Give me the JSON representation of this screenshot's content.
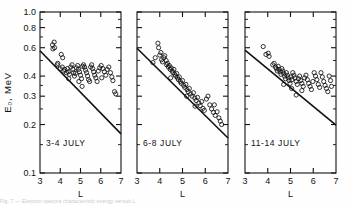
{
  "figure": {
    "axis_labels": {
      "y": "E₀, MeV",
      "y_plain": "E0, MeV",
      "x": "L"
    },
    "partial_caption": "Fig. 7 — Electron spectra characteristic energy versus L"
  },
  "chart_data": {
    "type": "scatter",
    "title": "",
    "xlabel": "L",
    "ylabel": "E₀, MeV",
    "yscale": "log",
    "xscale": "linear",
    "xlim": [
      3,
      7
    ],
    "ylim": [
      0.1,
      1.0
    ],
    "grid": false,
    "legend": null,
    "xticks": [
      3,
      4,
      5,
      6,
      7
    ],
    "xticklabels": [
      "3",
      "4",
      "5",
      "6",
      "7"
    ],
    "yticks": [
      1.0,
      0.8,
      0.6,
      0.4,
      0.3,
      0.2,
      0.1
    ],
    "yticklabels": [
      "1.0",
      "0.8",
      "0.6",
      "0.4",
      "0.3",
      "0.2",
      "0.1"
    ],
    "yminorticks": [
      0.9,
      0.7,
      0.5,
      0.35,
      0.25,
      0.15
    ],
    "marker": "open-circle",
    "panels": [
      {
        "label": "3-4 JULY",
        "trendline": {
          "x": [
            3,
            7
          ],
          "y": [
            0.575,
            0.175
          ]
        },
        "points": [
          [
            3.62,
            0.625
          ],
          [
            3.7,
            0.65
          ],
          [
            3.64,
            0.59
          ],
          [
            3.72,
            0.6
          ],
          [
            3.85,
            0.47
          ],
          [
            3.88,
            0.48
          ],
          [
            4.05,
            0.545
          ],
          [
            4.12,
            0.52
          ],
          [
            4.0,
            0.445
          ],
          [
            4.1,
            0.455
          ],
          [
            4.18,
            0.43
          ],
          [
            4.22,
            0.44
          ],
          [
            4.3,
            0.42
          ],
          [
            4.35,
            0.445
          ],
          [
            4.4,
            0.425
          ],
          [
            4.45,
            0.41
          ],
          [
            4.52,
            0.455
          ],
          [
            4.58,
            0.47
          ],
          [
            4.62,
            0.44
          ],
          [
            4.66,
            0.42
          ],
          [
            4.7,
            0.4
          ],
          [
            4.75,
            0.415
          ],
          [
            4.8,
            0.45
          ],
          [
            4.86,
            0.465
          ],
          [
            4.9,
            0.44
          ],
          [
            4.95,
            0.425
          ],
          [
            5.0,
            0.405
          ],
          [
            5.05,
            0.385
          ],
          [
            5.1,
            0.46
          ],
          [
            5.15,
            0.47
          ],
          [
            5.2,
            0.455
          ],
          [
            5.25,
            0.435
          ],
          [
            5.3,
            0.42
          ],
          [
            5.35,
            0.4
          ],
          [
            5.4,
            0.38
          ],
          [
            5.45,
            0.37
          ],
          [
            5.5,
            0.455
          ],
          [
            5.55,
            0.47
          ],
          [
            5.6,
            0.445
          ],
          [
            5.65,
            0.425
          ],
          [
            5.7,
            0.405
          ],
          [
            5.76,
            0.39
          ],
          [
            5.82,
            0.37
          ],
          [
            5.88,
            0.43
          ],
          [
            5.95,
            0.45
          ],
          [
            6.02,
            0.465
          ],
          [
            6.1,
            0.445
          ],
          [
            6.18,
            0.425
          ],
          [
            6.25,
            0.405
          ],
          [
            6.32,
            0.44
          ],
          [
            6.4,
            0.455
          ],
          [
            6.48,
            0.42
          ],
          [
            6.55,
            0.395
          ],
          [
            6.6,
            0.375
          ],
          [
            6.68,
            0.32
          ],
          [
            6.74,
            0.31
          ],
          [
            4.42,
            0.385
          ],
          [
            4.92,
            0.37
          ],
          [
            5.08,
            0.345
          ],
          [
            6.05,
            0.39
          ]
        ]
      },
      {
        "label": "6-8 JULY",
        "trendline": {
          "x": [
            3,
            7
          ],
          "y": [
            0.595,
            0.165
          ]
        },
        "points": [
          [
            3.92,
            0.64
          ],
          [
            3.95,
            0.6
          ],
          [
            3.7,
            0.485
          ],
          [
            3.8,
            0.52
          ],
          [
            4.0,
            0.54
          ],
          [
            4.05,
            0.56
          ],
          [
            4.08,
            0.505
          ],
          [
            4.12,
            0.49
          ],
          [
            4.18,
            0.52
          ],
          [
            4.22,
            0.535
          ],
          [
            4.28,
            0.5
          ],
          [
            4.3,
            0.47
          ],
          [
            4.34,
            0.48
          ],
          [
            4.38,
            0.455
          ],
          [
            4.42,
            0.465
          ],
          [
            4.46,
            0.44
          ],
          [
            4.5,
            0.45
          ],
          [
            4.55,
            0.43
          ],
          [
            4.58,
            0.42
          ],
          [
            4.62,
            0.44
          ],
          [
            4.66,
            0.41
          ],
          [
            4.7,
            0.4
          ],
          [
            4.74,
            0.415
          ],
          [
            4.78,
            0.39
          ],
          [
            4.82,
            0.38
          ],
          [
            4.86,
            0.395
          ],
          [
            4.9,
            0.37
          ],
          [
            4.95,
            0.36
          ],
          [
            5.0,
            0.375
          ],
          [
            5.05,
            0.35
          ],
          [
            5.1,
            0.34
          ],
          [
            5.15,
            0.355
          ],
          [
            5.2,
            0.33
          ],
          [
            5.25,
            0.32
          ],
          [
            5.3,
            0.335
          ],
          [
            5.36,
            0.31
          ],
          [
            5.42,
            0.3
          ],
          [
            5.48,
            0.315
          ],
          [
            5.54,
            0.292
          ],
          [
            5.6,
            0.282
          ],
          [
            5.66,
            0.295
          ],
          [
            5.72,
            0.272
          ],
          [
            5.78,
            0.262
          ],
          [
            5.84,
            0.278
          ],
          [
            5.9,
            0.252
          ],
          [
            5.96,
            0.245
          ],
          [
            6.05,
            0.288
          ],
          [
            6.12,
            0.3
          ],
          [
            6.2,
            0.265
          ],
          [
            6.28,
            0.25
          ],
          [
            6.36,
            0.238
          ],
          [
            6.44,
            0.228
          ],
          [
            6.52,
            0.24
          ],
          [
            6.6,
            0.22
          ],
          [
            6.66,
            0.21
          ],
          [
            6.72,
            0.2
          ],
          [
            4.48,
            0.39
          ],
          [
            5.18,
            0.3
          ],
          [
            5.55,
            0.26
          ],
          [
            6.4,
            0.265
          ]
        ]
      },
      {
        "label": "11-14 JULY",
        "trendline": {
          "x": [
            3,
            7
          ],
          "y": [
            0.58,
            0.198
          ]
        },
        "points": [
          [
            3.8,
            0.61
          ],
          [
            3.92,
            0.545
          ],
          [
            4.02,
            0.555
          ],
          [
            4.06,
            0.53
          ],
          [
            4.22,
            0.47
          ],
          [
            4.28,
            0.48
          ],
          [
            4.34,
            0.455
          ],
          [
            4.38,
            0.445
          ],
          [
            4.42,
            0.43
          ],
          [
            4.46,
            0.46
          ],
          [
            4.5,
            0.44
          ],
          [
            4.54,
            0.425
          ],
          [
            4.58,
            0.41
          ],
          [
            4.62,
            0.445
          ],
          [
            4.66,
            0.43
          ],
          [
            4.7,
            0.415
          ],
          [
            4.74,
            0.4
          ],
          [
            4.78,
            0.385
          ],
          [
            4.82,
            0.42
          ],
          [
            4.86,
            0.405
          ],
          [
            4.9,
            0.39
          ],
          [
            4.94,
            0.375
          ],
          [
            4.98,
            0.36
          ],
          [
            5.02,
            0.395
          ],
          [
            5.06,
            0.38
          ],
          [
            5.1,
            0.42
          ],
          [
            5.15,
            0.405
          ],
          [
            5.2,
            0.39
          ],
          [
            5.25,
            0.37
          ],
          [
            5.3,
            0.355
          ],
          [
            5.35,
            0.385
          ],
          [
            5.4,
            0.4
          ],
          [
            5.45,
            0.375
          ],
          [
            5.5,
            0.36
          ],
          [
            5.56,
            0.345
          ],
          [
            5.62,
            0.39
          ],
          [
            5.68,
            0.405
          ],
          [
            5.74,
            0.38
          ],
          [
            5.8,
            0.36
          ],
          [
            5.86,
            0.345
          ],
          [
            5.92,
            0.33
          ],
          [
            5.98,
            0.37
          ],
          [
            6.04,
            0.42
          ],
          [
            6.1,
            0.4
          ],
          [
            6.16,
            0.38
          ],
          [
            6.22,
            0.355
          ],
          [
            6.28,
            0.34
          ],
          [
            6.34,
            0.42
          ],
          [
            6.4,
            0.395
          ],
          [
            6.46,
            0.37
          ],
          [
            6.52,
            0.35
          ],
          [
            6.58,
            0.335
          ],
          [
            6.64,
            0.32
          ],
          [
            6.7,
            0.4
          ],
          [
            6.76,
            0.375
          ],
          [
            6.8,
            0.345
          ],
          [
            4.7,
            0.355
          ],
          [
            5.05,
            0.335
          ],
          [
            5.25,
            0.305
          ],
          [
            5.5,
            0.325
          ]
        ]
      }
    ]
  }
}
